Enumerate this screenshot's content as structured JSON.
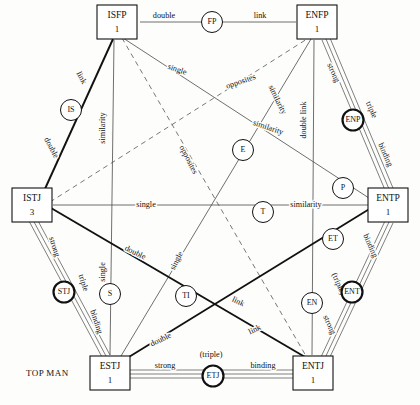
{
  "diagram": {
    "title_corner": "TOP MAN",
    "nodes": [
      {
        "id": "ISFP",
        "label": "ISFP",
        "count": "1",
        "x": 117,
        "y": 22
      },
      {
        "id": "ENFP",
        "label": "ENFP",
        "count": "1",
        "x": 317,
        "y": 22
      },
      {
        "id": "ENTP",
        "label": "ENTP",
        "count": "1",
        "x": 388,
        "y": 205
      },
      {
        "id": "ENTJ",
        "label": "ENTJ",
        "count": "1",
        "x": 313,
        "y": 373
      },
      {
        "id": "ESTJ",
        "label": "ESTJ",
        "count": "1",
        "x": 110,
        "y": 373
      },
      {
        "id": "ISTJ",
        "label": "ISTJ",
        "count": "3",
        "x": 32,
        "y": 205
      }
    ],
    "circles": [
      {
        "id": "FP",
        "label": "FP",
        "x": 212,
        "y": 22,
        "bold": false
      },
      {
        "id": "IS",
        "label": "IS",
        "x": 71,
        "y": 110,
        "bold": false
      },
      {
        "id": "ENP",
        "label": "ENP",
        "x": 353,
        "y": 120,
        "bold": true
      },
      {
        "id": "E",
        "label": "E",
        "x": 243,
        "y": 150,
        "bold": false
      },
      {
        "id": "P",
        "label": "P",
        "x": 343,
        "y": 188,
        "bold": false
      },
      {
        "id": "T",
        "label": "T",
        "x": 263,
        "y": 212,
        "bold": false
      },
      {
        "id": "ET",
        "label": "ET",
        "x": 333,
        "y": 239,
        "bold": false
      },
      {
        "id": "STJ",
        "label": "STJ",
        "x": 64,
        "y": 292,
        "bold": true
      },
      {
        "id": "S",
        "label": "S",
        "x": 110,
        "y": 294,
        "bold": false
      },
      {
        "id": "TI",
        "label": "TI",
        "x": 186,
        "y": 296,
        "bold": false
      },
      {
        "id": "EN",
        "label": "EN",
        "x": 312,
        "y": 303,
        "bold": false
      },
      {
        "id": "ENT",
        "label": "ENT",
        "x": 352,
        "y": 292,
        "bold": true
      },
      {
        "id": "ETJ",
        "label": "ETJ",
        "x": 213,
        "y": 376,
        "bold": true
      }
    ],
    "edges": [
      {
        "id": "isfp-enfp",
        "from": "ISFP",
        "to": "ENFP",
        "style": "plain",
        "labels": [
          "double",
          "link"
        ]
      },
      {
        "id": "isfp-istj",
        "from": "ISFP",
        "to": "ISTJ",
        "style": "bold",
        "labels": [
          "link",
          "double"
        ]
      },
      {
        "id": "enfp-entp",
        "from": "ENFP",
        "to": "ENTP",
        "style": "rail3",
        "labels": [
          "strong",
          "triple",
          "binding"
        ]
      },
      {
        "id": "istj-estj",
        "from": "ISTJ",
        "to": "ESTJ",
        "style": "rail3",
        "labels": [
          "strong",
          "triple",
          "binding"
        ]
      },
      {
        "id": "entp-entj",
        "from": "ENTP",
        "to": "ENTJ",
        "style": "rail3",
        "labels": [
          "binding",
          "(triple)",
          "strong"
        ]
      },
      {
        "id": "estj-entj",
        "from": "ESTJ",
        "to": "ENTJ",
        "style": "rail3",
        "labels": [
          "strong",
          "(triple)",
          "binding"
        ]
      },
      {
        "id": "istj-entp",
        "from": "ISTJ",
        "to": "ENTP",
        "style": "plain",
        "labels": [
          "single",
          "similarity"
        ]
      },
      {
        "id": "isfp-estj",
        "from": "ISFP",
        "to": "ESTJ",
        "style": "plain",
        "labels": [
          "similarity",
          "single"
        ]
      },
      {
        "id": "enfp-entj",
        "from": "ENFP",
        "to": "ENTJ",
        "style": "plain",
        "labels": [
          "double link"
        ]
      },
      {
        "id": "isfp-entp",
        "from": "ISFP",
        "to": "ENTP",
        "style": "plain",
        "labels": [
          "single",
          "similarity"
        ]
      },
      {
        "id": "enfp-estj",
        "from": "ENFP",
        "to": "ESTJ",
        "style": "plain",
        "labels": [
          "similarity",
          "single"
        ]
      },
      {
        "id": "istj-entj",
        "from": "ISTJ",
        "to": "ENTJ",
        "style": "bold",
        "labels": [
          "double",
          "link"
        ]
      },
      {
        "id": "estj-entp",
        "from": "ESTJ",
        "to": "ENTP",
        "style": "bold",
        "labels": [
          "double",
          "link"
        ]
      },
      {
        "id": "isfp-entj",
        "from": "ISFP",
        "to": "ENTJ",
        "style": "dashed",
        "labels": [
          "opposites"
        ]
      },
      {
        "id": "istj-enfp",
        "from": "ISTJ",
        "to": "ENFP",
        "style": "dashed",
        "labels": [
          "opposites"
        ]
      }
    ],
    "edge_labels": [
      {
        "id": "lbl-double-top",
        "text": "double",
        "x": 164,
        "y": 16,
        "rot": 0
      },
      {
        "id": "lbl-link-top",
        "text": "link",
        "x": 260,
        "y": 16,
        "rot": 0
      },
      {
        "id": "lbl-link-is",
        "text": "link",
        "x": 81,
        "y": 78,
        "rot": 62
      },
      {
        "id": "lbl-double-is",
        "text": "double",
        "x": 51,
        "y": 148,
        "rot": 62
      },
      {
        "id": "lbl-similarity-isfp-estj",
        "text": "similarity",
        "x": 103,
        "y": 128,
        "rot": -90
      },
      {
        "id": "lbl-single-isfp-entp",
        "text": "single",
        "x": 177,
        "y": 70,
        "rot": 19
      },
      {
        "id": "lbl-similarity-isfp-entp",
        "text": "similarity",
        "x": 268,
        "y": 128,
        "rot": 19
      },
      {
        "id": "lbl-opposites-istj-enfp",
        "text": "opposites",
        "x": 241,
        "y": 82,
        "rot": -19
      },
      {
        "id": "lbl-opposites-isfp-entj",
        "text": "opposites",
        "x": 188,
        "y": 160,
        "rot": 63
      },
      {
        "id": "lbl-similarity-enfp-estj",
        "text": "similarity",
        "x": 277,
        "y": 100,
        "rot": 64
      },
      {
        "id": "lbl-double-link",
        "text": "double link",
        "x": 304,
        "y": 120,
        "rot": -90
      },
      {
        "id": "lbl-strong-enp",
        "text": "strong",
        "x": 333,
        "y": 73,
        "rot": 66
      },
      {
        "id": "lbl-triple-enp",
        "text": "triple",
        "x": 371,
        "y": 110,
        "rot": 66
      },
      {
        "id": "lbl-binding-enp",
        "text": "binding",
        "x": 385,
        "y": 155,
        "rot": 66
      },
      {
        "id": "lbl-single-mid",
        "text": "single",
        "x": 146,
        "y": 205,
        "rot": 0
      },
      {
        "id": "lbl-similarity-mid",
        "text": "similarity",
        "x": 306,
        "y": 205,
        "rot": 0
      },
      {
        "id": "lbl-strong-stj",
        "text": "strong",
        "x": 54,
        "y": 247,
        "rot": 72
      },
      {
        "id": "lbl-triple-stj",
        "text": "triple",
        "x": 83,
        "y": 283,
        "rot": 72
      },
      {
        "id": "lbl-binding-stj",
        "text": "binding",
        "x": 96,
        "y": 322,
        "rot": 72
      },
      {
        "id": "lbl-single-vert",
        "text": "single",
        "x": 103,
        "y": 272,
        "rot": -90
      },
      {
        "id": "lbl-double-istj-entj",
        "text": "double",
        "x": 135,
        "y": 253,
        "rot": 26
      },
      {
        "id": "lbl-link-istj-entj",
        "text": "link",
        "x": 238,
        "y": 302,
        "rot": 26
      },
      {
        "id": "lbl-single-enfp-estj",
        "text": "single",
        "x": 177,
        "y": 261,
        "rot": -63
      },
      {
        "id": "lbl-link-estj-entp",
        "text": "link",
        "x": 255,
        "y": 330,
        "rot": -26
      },
      {
        "id": "lbl-double-estj-entp",
        "text": "double",
        "x": 161,
        "y": 340,
        "rot": -26
      },
      {
        "id": "lbl-binding-ent",
        "text": "binding",
        "x": 370,
        "y": 246,
        "rot": 66
      },
      {
        "id": "lbl-triple-ent",
        "text": "(triple)",
        "x": 338,
        "y": 284,
        "rot": 66
      },
      {
        "id": "lbl-strong-ent",
        "text": "strong",
        "x": 329,
        "y": 325,
        "rot": 66
      },
      {
        "id": "lbl-strong-bottom",
        "text": "strong",
        "x": 165,
        "y": 366,
        "rot": 0
      },
      {
        "id": "lbl-triple-bottom",
        "text": "(triple)",
        "x": 211,
        "y": 355,
        "rot": 0
      },
      {
        "id": "lbl-binding-bottom",
        "text": "binding",
        "x": 263,
        "y": 366,
        "rot": 0
      }
    ]
  }
}
